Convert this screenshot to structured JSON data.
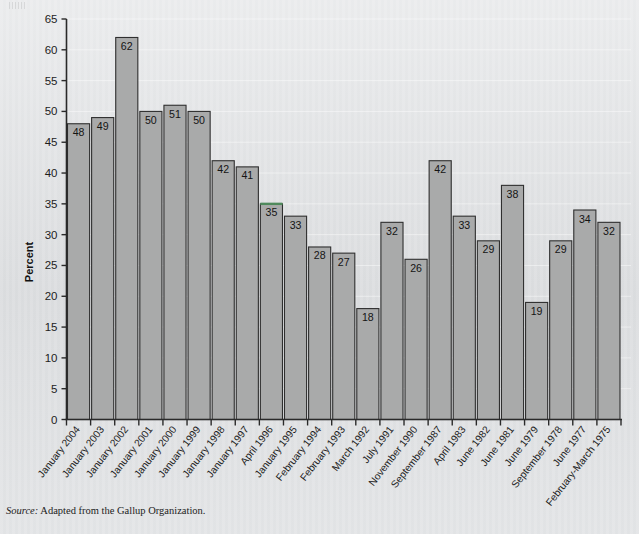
{
  "figure": {
    "source_label": "Source:",
    "source_text": " Adapted from the Gallup Organization."
  },
  "chart_data": {
    "type": "bar",
    "title": "",
    "xlabel": "",
    "ylabel": "Percent",
    "ylim": [
      0,
      65
    ],
    "ytick_step": 5,
    "yticks": [
      0,
      5,
      10,
      15,
      20,
      25,
      30,
      35,
      40,
      45,
      50,
      55,
      60,
      65
    ],
    "grid": false,
    "legend": null,
    "bar_color": "#a9aaaa",
    "bar_edge_color": "#2f2f2f",
    "highlight_color": "#4f8a5c",
    "highlighted_category": "April 1996",
    "categories": [
      "January 2004",
      "January 2003",
      "January 2002",
      "January 2001",
      "January 2000",
      "January 1999",
      "January 1998",
      "January 1997",
      "April 1996",
      "January 1995",
      "February 1994",
      "February 1993",
      "March 1992",
      "July 1991",
      "November 1990",
      "September 1987",
      "April 1983",
      "June 1982",
      "June 1981",
      "June 1979",
      "September 1978",
      "June 1977",
      "February-March 1975"
    ],
    "values": [
      48,
      49,
      62,
      50,
      51,
      50,
      42,
      41,
      35,
      33,
      28,
      27,
      18,
      32,
      26,
      42,
      33,
      29,
      38,
      19,
      29,
      34,
      32
    ],
    "data_labels": [
      "48",
      "49",
      "62",
      "50",
      "51",
      "50",
      "42",
      "41",
      "35",
      "33",
      "28",
      "27",
      "18",
      "32",
      "26",
      "42",
      "33",
      "29",
      "38",
      "19",
      "29",
      "34",
      "32"
    ]
  }
}
